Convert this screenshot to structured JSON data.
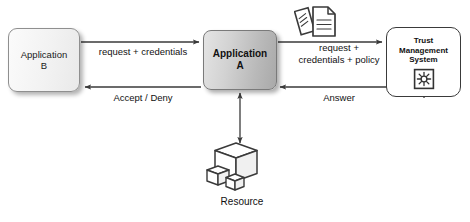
{
  "diagram": {
    "background_color": "#ffffff",
    "line_color": "#3a3a3a",
    "nodes": {
      "application_b": {
        "label_line1": "Application",
        "label_line2": "B",
        "fill_color": "#f2f2f2"
      },
      "application_a": {
        "label_line1": "Application",
        "label_line2": "A",
        "fill_color": "#c6c6c6"
      },
      "trust_management_system": {
        "label_line1": "Trust",
        "label_line2": "Management",
        "label_line3": "System",
        "fill_color": "#ffffff",
        "icon": "starburst-badge-icon"
      },
      "resource": {
        "label": "Resource",
        "icon": "cubes-icon"
      }
    },
    "icons": {
      "policy_documents": "documents-icon"
    },
    "edges": [
      {
        "id": "b-to-a",
        "from": "application_b",
        "to": "application_a",
        "label": "request + credentials",
        "direction": "forward"
      },
      {
        "id": "a-to-b",
        "from": "application_a",
        "to": "application_b",
        "label": "Accept / Deny",
        "direction": "forward"
      },
      {
        "id": "a-to-tms",
        "from": "application_a",
        "to": "trust_management_system",
        "label_line1": "request +",
        "label_line2": "credentials + policy",
        "direction": "forward"
      },
      {
        "id": "tms-to-a",
        "from": "trust_management_system",
        "to": "application_a",
        "label": "Answer",
        "direction": "forward"
      },
      {
        "id": "a-to-resource",
        "from": "application_a",
        "to": "resource",
        "label": "",
        "direction": "bidirectional"
      }
    ]
  }
}
